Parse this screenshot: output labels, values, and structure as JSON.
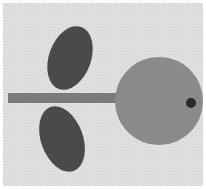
{
  "scene": {
    "description": "Grayscale cut-out shapes on textured fabric: a large circle with a small dark dot, a horizontal stem, and two leaf shapes",
    "colors": {
      "background": "#e4e4e4",
      "texture": "#cfcfcf",
      "circle": "#8a8a8a",
      "stem": "#7a7a7a",
      "leaf": "#4a4a4a",
      "dot": "#2a2a2a"
    },
    "circle": {
      "cx": 159,
      "cy": 101,
      "r": 44
    },
    "dot": {
      "cx": 191,
      "cy": 103,
      "r": 5
    },
    "stem": {
      "x": 8,
      "y": 93,
      "width": 108,
      "height": 10
    },
    "leaves": [
      {
        "name": "top",
        "cx": 70,
        "cy": 58,
        "rx": 21,
        "ry": 33,
        "rotate": 20
      },
      {
        "name": "bottom",
        "cx": 62,
        "cy": 139,
        "rx": 21,
        "ry": 34,
        "rotate": -20
      }
    ]
  }
}
